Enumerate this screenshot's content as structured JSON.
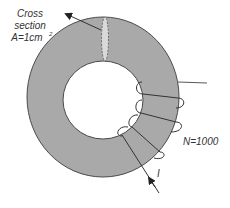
{
  "diagram": {
    "type": "toroid-coil",
    "cross_section_label": {
      "line1": "Cross",
      "line2": "section",
      "line3": "A=1cm",
      "superscript": "2"
    },
    "turns_label": "N=1000",
    "current_label": "I",
    "colors": {
      "core_fill": "#a9a9a9",
      "core_outline": "#4a4a4a",
      "cross_section_fill": "#d9d9d9",
      "wire": "#333333",
      "text": "#333333"
    }
  }
}
